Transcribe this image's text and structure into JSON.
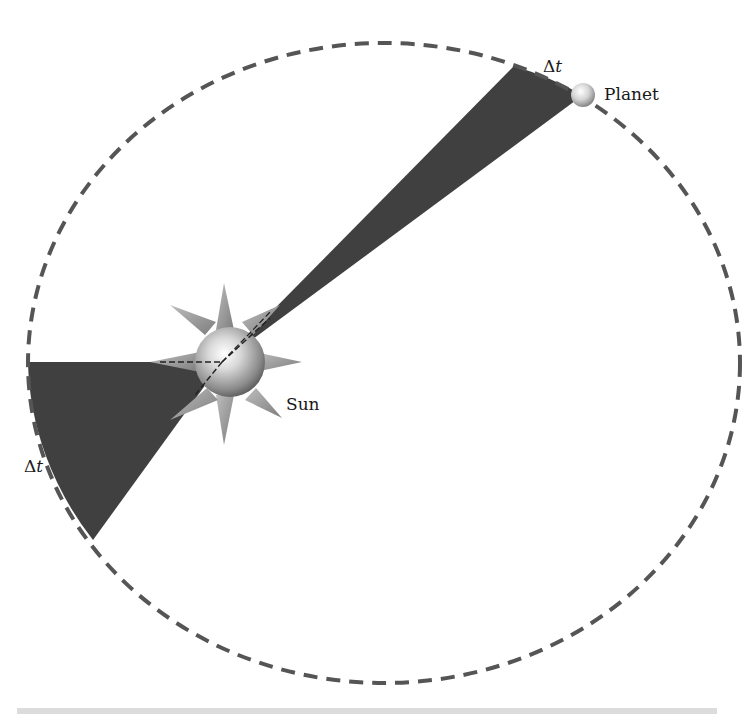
{
  "diagram": {
    "labels": {
      "planet": "Planet",
      "sun": "Sun",
      "delta_t_top_symbol": "Δ",
      "delta_t_top_var": "t",
      "delta_t_bottom_symbol": "Δ",
      "delta_t_bottom_var": "t"
    },
    "orbit": {
      "cx": 384,
      "cy": 363,
      "rx": 356,
      "ry": 320,
      "stroke": "#555555",
      "dash": "14 9"
    },
    "sun": {
      "cx": 230,
      "cy": 362,
      "r": 35,
      "rays": 8
    },
    "focus": {
      "x": 222,
      "y": 362
    },
    "planet": {
      "cx": 583,
      "cy": 95,
      "r": 12
    },
    "wedges": [
      {
        "name": "near-aphelion-sweep",
        "from": [
          28,
          362
        ],
        "to": [
          93,
          540
        ],
        "fill": "#404040"
      },
      {
        "name": "near-perihelion-sweep",
        "from": [
          514,
          66
        ],
        "to": [
          583,
          95
        ],
        "fill": "#404040"
      }
    ],
    "colors": {
      "wedge": "#404040",
      "orbit": "#555555",
      "bar": "#dcdcdc"
    }
  }
}
